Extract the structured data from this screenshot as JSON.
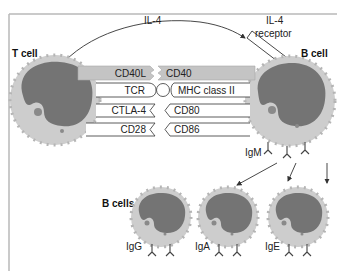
{
  "colors": {
    "frame": "#b9b9b9",
    "cytoplasm": "#cdcdcd",
    "cytoplasm_edge": "#b5b5b5",
    "nucleus": "#747474",
    "bar_gray": "#c4c4c4",
    "bar_white": "#ffffff",
    "line": "#333333"
  },
  "labels": {
    "t_cell": "T cell",
    "b_cell": "B cell",
    "il4": "IL-4",
    "il4_receptor_line1": "IL-4",
    "il4_receptor_line2": "receptor",
    "b_cells": "B cells",
    "igm": "IgM"
  },
  "interactions": [
    {
      "t_side": "CD40L",
      "b_side": "CD40",
      "style": "gray"
    },
    {
      "t_side": "TCR",
      "b_side": "MHC class II",
      "style": "white-round"
    },
    {
      "t_side": "CTLA-4",
      "b_side": "CD80",
      "style": "white-chevron"
    },
    {
      "t_side": "CD28",
      "b_side": "CD86",
      "style": "white-chevron"
    }
  ],
  "daughter_cells": [
    {
      "label": "IgG"
    },
    {
      "label": "IgA"
    },
    {
      "label": "IgE"
    }
  ]
}
